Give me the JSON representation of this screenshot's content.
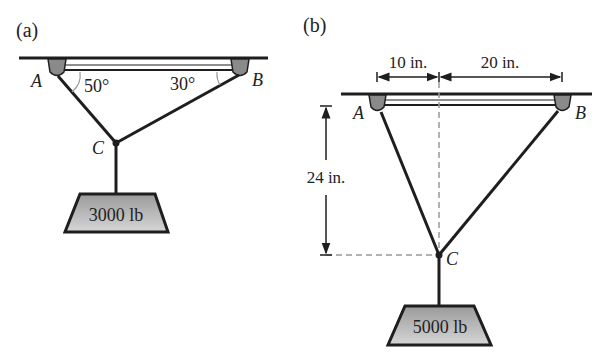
{
  "panel_a": {
    "label": "(a)",
    "point_a": "A",
    "point_b": "B",
    "point_c": "C",
    "angle_a": "50°",
    "angle_b": "30°",
    "weight": "3000 lb"
  },
  "panel_b": {
    "label": "(b)",
    "point_a": "A",
    "point_b": "B",
    "point_c": "C",
    "dim_left": "10 in.",
    "dim_right": "20 in.",
    "dim_vertical": "24 in.",
    "weight": "5000 lb"
  },
  "colors": {
    "line": "#1e1e1e",
    "support_fill": "#8a8a8a",
    "weight_fill": "#c4c4c4",
    "dash": "#999999"
  }
}
